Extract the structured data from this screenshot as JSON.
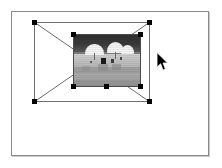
{
  "scene": {
    "type": "image-editor-selection",
    "canvas": {
      "name": "document-canvas",
      "background_color": "#ffffff",
      "border_color": "#8a8a8a",
      "x": 11,
      "y": 11,
      "width": 198,
      "height": 145
    },
    "outer_selection": {
      "name": "placeholder-bounding-box",
      "x": 33,
      "y": 21,
      "width": 116,
      "height": 80,
      "stroke_color": "#6e6e6e",
      "diagonals": true,
      "handle_color": "#000000",
      "handles": [
        {
          "label": "top-left",
          "x": 0,
          "y": 0
        },
        {
          "label": "top-right",
          "x": 116,
          "y": 0
        },
        {
          "label": "bottom-left",
          "x": 0,
          "y": 80
        },
        {
          "label": "bottom-right",
          "x": 116,
          "y": 80
        }
      ]
    },
    "photo_object": {
      "name": "beach-photo",
      "x": 72,
      "y": 33,
      "width": 68,
      "height": 53,
      "border_color": "#4a4a4a",
      "palette": {
        "sky": "#343434",
        "horizon": "#7d7d7d",
        "sand": "#c2c2c2",
        "umbrella": "#f4f4f4",
        "figure": "#1b1b1b"
      },
      "content_description": "grayscale beach scene with white umbrellas and figures on sand",
      "handles": [
        {
          "label": "top-left",
          "x": 0,
          "y": 0
        },
        {
          "label": "top-right",
          "x": 68,
          "y": 0
        },
        {
          "label": "bottom-left",
          "x": 0,
          "y": 53
        },
        {
          "label": "bottom-center",
          "x": 34,
          "y": 53
        },
        {
          "label": "bottom-right",
          "x": 68,
          "y": 53
        }
      ]
    },
    "cursor": {
      "name": "mouse-pointer",
      "shape": "arrow",
      "color": "#000000",
      "x": 156,
      "y": 52
    }
  }
}
